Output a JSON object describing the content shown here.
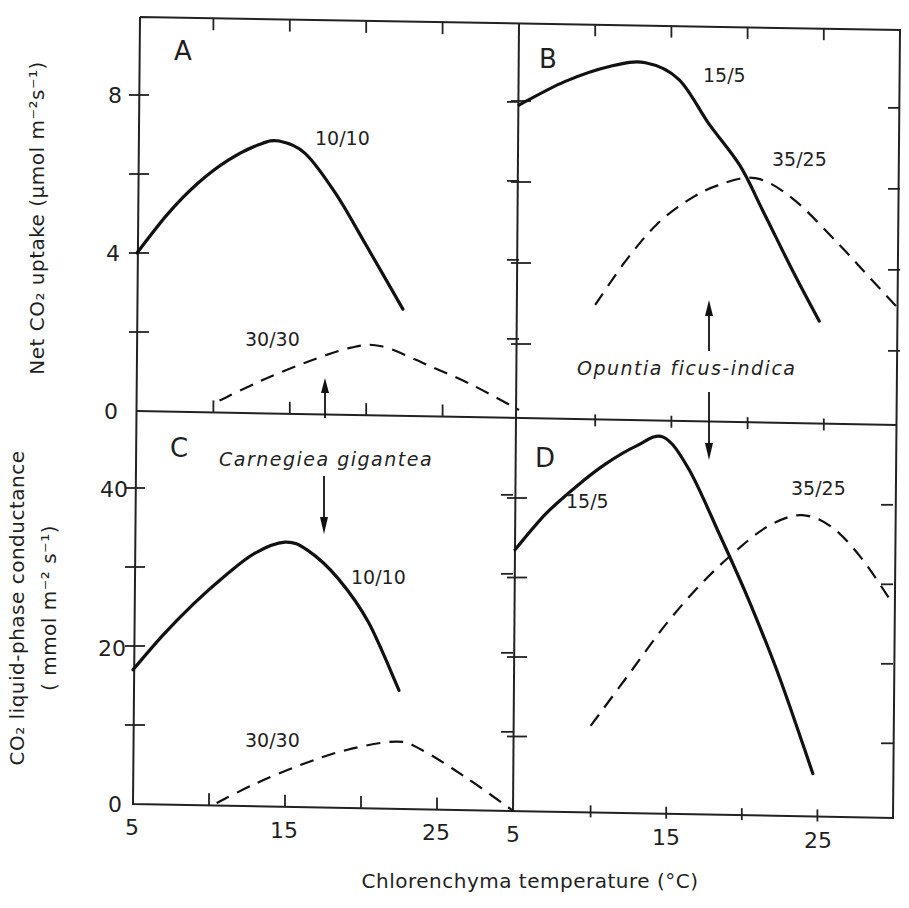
{
  "figure": {
    "x_axis_title": "Chlorenchyma temperature (°C)",
    "y_axis_top_title": "Net CO₂ uptake (μmol m⁻²s⁻¹)",
    "y_axis_bottom_title_line1": "CO₂ liquid-phase conductance",
    "y_axis_bottom_title_line2": "( mmol m⁻² s⁻¹)",
    "species_left": "Carnegiea gigantea",
    "species_right": "Opuntia ficus-indica",
    "x_tick_labels_left": [
      "5",
      "15",
      "25"
    ],
    "x_tick_labels_right": [
      "5",
      "15",
      "25"
    ],
    "y_tick_labels_top": [
      "0",
      "4",
      "8"
    ],
    "y_tick_labels_bottom": [
      "0",
      "20",
      "40"
    ],
    "panels": {
      "A": {
        "letter": "A",
        "solid_label": "10/10",
        "dashed_label": "30/30"
      },
      "B": {
        "letter": "B",
        "solid_label": "15/5",
        "dashed_label": "35/25"
      },
      "C": {
        "letter": "C",
        "solid_label": "10/10",
        "dashed_label": "30/30"
      },
      "D": {
        "letter": "D",
        "solid_label": "15/5",
        "dashed_label": "35/25"
      }
    }
  },
  "chart_data": [
    {
      "panel": "A",
      "type": "line",
      "title": "",
      "species": "Carnegiea gigantea",
      "xlabel": "Chlorenchyma temperature (°C)",
      "ylabel": "Net CO2 uptake (μmol m-2 s-1)",
      "xlim": [
        5,
        30
      ],
      "ylim": [
        0,
        10
      ],
      "x_ticks": [
        5,
        10,
        15,
        20,
        25,
        30
      ],
      "y_ticks": [
        0,
        2,
        4,
        6,
        8
      ],
      "series": [
        {
          "name": "10/10",
          "style": "solid",
          "x": [
            5,
            7,
            9,
            11,
            13,
            14.3,
            16,
            18,
            20,
            22.4
          ],
          "y": [
            4.0,
            5.0,
            5.8,
            6.4,
            6.8,
            6.9,
            6.6,
            5.6,
            4.3,
            2.7
          ]
        },
        {
          "name": "30/30",
          "style": "dashed",
          "x": [
            10.4,
            13,
            16,
            19,
            21,
            24,
            27,
            30
          ],
          "y": [
            0.3,
            0.8,
            1.3,
            1.7,
            1.75,
            1.3,
            0.8,
            0.2
          ]
        }
      ]
    },
    {
      "panel": "B",
      "type": "line",
      "title": "",
      "species": "Opuntia ficus-indica",
      "xlabel": "Chlorenchyma temperature (°C)",
      "ylabel": "Net CO2 uptake (μmol m-2 s-1)",
      "xlim": [
        5,
        30
      ],
      "ylim": [
        0,
        10
      ],
      "x_ticks": [
        5,
        10,
        15,
        20,
        25,
        30
      ],
      "y_ticks": [
        0,
        2,
        4,
        6,
        8
      ],
      "series": [
        {
          "name": "15/5",
          "style": "solid",
          "x": [
            5,
            8,
            11,
            13.3,
            15.5,
            17.5,
            19.5,
            21,
            23,
            24.7
          ],
          "y": [
            7.9,
            8.5,
            8.9,
            9.0,
            8.6,
            7.5,
            6.5,
            5.4,
            3.9,
            2.7
          ]
        },
        {
          "name": "35/25",
          "style": "dashed",
          "x": [
            10,
            12,
            14,
            16,
            18,
            20.5,
            23,
            26,
            28,
            30
          ],
          "y": [
            3.0,
            4.1,
            5.0,
            5.6,
            6.0,
            6.2,
            5.7,
            4.6,
            3.8,
            3.0
          ]
        }
      ]
    },
    {
      "panel": "C",
      "type": "line",
      "title": "",
      "species": "Carnegiea gigantea",
      "xlabel": "Chlorenchyma temperature (°C)",
      "ylabel": "CO2 liquid-phase conductance (mmol m-2 s-1)",
      "xlim": [
        5,
        30
      ],
      "ylim": [
        0,
        49
      ],
      "x_ticks": [
        5,
        10,
        15,
        20,
        25,
        30
      ],
      "y_ticks": [
        0,
        10,
        20,
        30,
        40
      ],
      "series": [
        {
          "name": "10/10",
          "style": "solid",
          "x": [
            5,
            7,
            9,
            11,
            13,
            15,
            16.5,
            18.5,
            20.5,
            22.5
          ],
          "y": [
            17.0,
            21.5,
            25.5,
            29.0,
            32.0,
            33.5,
            32.5,
            29.0,
            23.5,
            15.0
          ]
        },
        {
          "name": "30/30",
          "style": "dashed",
          "x": [
            10.5,
            13,
            16,
            19,
            22.3,
            24,
            27,
            30
          ],
          "y": [
            0.3,
            2.8,
            5.3,
            7.3,
            8.5,
            7.5,
            4.0,
            0.0
          ]
        }
      ]
    },
    {
      "panel": "D",
      "type": "line",
      "title": "",
      "species": "Opuntia ficus-indica",
      "xlabel": "Chlorenchyma temperature (°C)",
      "ylabel": "CO2 liquid-phase conductance (mmol m-2 s-1)",
      "xlim": [
        5,
        30
      ],
      "ylim": [
        0,
        49
      ],
      "x_ticks": [
        5,
        10,
        15,
        20,
        25,
        30
      ],
      "y_ticks": [
        0,
        10,
        20,
        30,
        40
      ],
      "series": [
        {
          "name": "15/5",
          "style": "solid",
          "x": [
            5,
            7,
            9,
            11,
            13,
            14.8,
            16.5,
            18.5,
            20.5,
            22.5,
            24.7
          ],
          "y": [
            33.5,
            38.0,
            41.5,
            44.5,
            46.8,
            48.0,
            44.0,
            36.0,
            27.5,
            18.0,
            6.0
          ]
        },
        {
          "name": "35/25",
          "style": "dashed",
          "x": [
            10,
            12.5,
            15,
            17.5,
            20,
            22,
            24,
            26,
            28,
            30
          ],
          "y": [
            11.5,
            18.0,
            24.5,
            30.0,
            34.5,
            37.3,
            38.5,
            37.0,
            33.0,
            27.5
          ]
        }
      ]
    }
  ]
}
